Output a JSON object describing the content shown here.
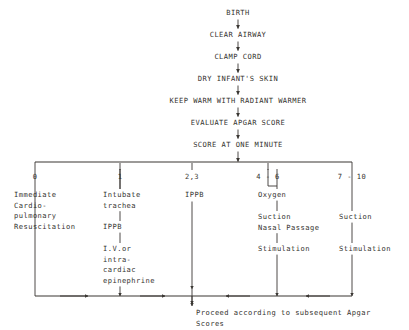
{
  "diagram": {
    "title_sequence": [
      {
        "label": "BIRTH",
        "y": 8
      },
      {
        "label": "CLEAR AIRWAY",
        "y": 30
      },
      {
        "label": "CLAMP CORD",
        "y": 52
      },
      {
        "label": "DRY INFANT'S SKIN",
        "y": 74
      },
      {
        "label": "KEEP WARM WITH RADIANT WARMER",
        "y": 96
      },
      {
        "label": "EVALUATE APGAR SCORE",
        "y": 118
      },
      {
        "label": "SCORE AT ONE MINUTE",
        "y": 140
      }
    ],
    "scale": {
      "ticks": [
        {
          "label": "0",
          "x": 35
        },
        {
          "label": "1",
          "x": 120
        },
        {
          "label": "2,3",
          "x": 192
        },
        {
          "label": "4 - 6",
          "x": 268
        },
        {
          "label": "7 - 10",
          "x": 352
        }
      ]
    },
    "columns": [
      {
        "name": "score-0",
        "text_x": 14,
        "line_x": 35,
        "blocks": [
          {
            "lines": [
              "Immediate",
              "Cardio-",
              "pulmonary",
              "Resuscitation"
            ],
            "y": 190
          }
        ]
      },
      {
        "name": "score-1",
        "text_x": 103,
        "line_x": 120,
        "blocks": [
          {
            "lines": [
              "Intubate",
              "trachea"
            ],
            "y": 190
          },
          {
            "lines": [
              "IPPB"
            ],
            "y": 222
          },
          {
            "lines": [
              "I.V.or",
              "intra-",
              "cardiac",
              "epinephrine"
            ],
            "y": 244
          }
        ]
      },
      {
        "name": "score-2-3",
        "text_x": 185,
        "line_x": 192,
        "blocks": [
          {
            "lines": [
              "IPPB"
            ],
            "y": 190
          }
        ]
      },
      {
        "name": "score-4-6",
        "text_x": 258,
        "line_x": 277,
        "blocks": [
          {
            "lines": [
              "Oxygen"
            ],
            "y": 190
          },
          {
            "lines": [
              "Suction",
              "Nasal Passage"
            ],
            "y": 212
          },
          {
            "lines": [
              "Stimulation"
            ],
            "y": 244
          }
        ]
      },
      {
        "name": "score-7-10",
        "text_x": 339,
        "line_x": 352,
        "blocks": [
          {
            "lines": [
              "Suction"
            ],
            "y": 212
          },
          {
            "lines": [
              "Stimulation"
            ],
            "y": 244
          }
        ]
      }
    ],
    "outcome": {
      "lines": [
        "Proceed according to subsequent Apgar",
        "Scores"
      ],
      "x": 196,
      "y": 308
    }
  }
}
